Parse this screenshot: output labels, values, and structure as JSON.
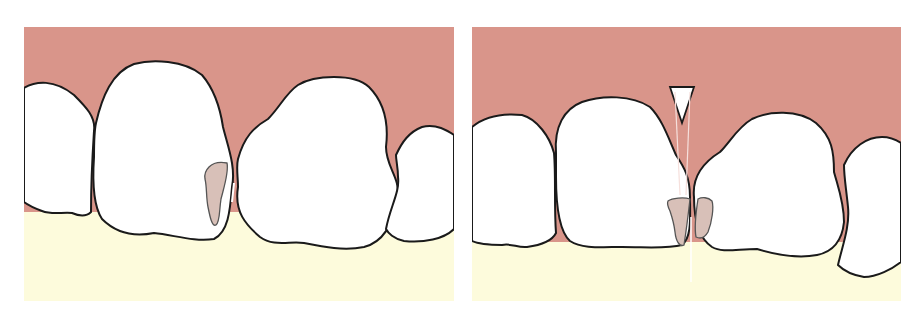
{
  "figure": {
    "panels": [
      {
        "id": "left",
        "description": "Two central incisors with interproximal caries lesion on mesial surface of left tooth; gingiva intact between teeth",
        "elements": [
          "gingiva",
          "lateral-incisor-left",
          "central-incisor-left",
          "central-incisor-right",
          "lateral-incisor-right",
          "caries-lesion"
        ]
      },
      {
        "id": "right",
        "description": "Same teeth with wooden wedge inserted interproximally separating the teeth; lesions on both adjacent surfaces",
        "elements": [
          "gingiva",
          "lateral-incisor-left",
          "central-incisor-left",
          "central-incisor-right",
          "lateral-incisor-right",
          "wedge",
          "caries-lesion-left",
          "caries-lesion-right"
        ]
      }
    ],
    "colors": {
      "gingiva": "#d9958a",
      "attached_area": "#fdfbdc",
      "tooth": "#ffffff",
      "outline": "#1a1a1a",
      "lesion": "#d8c0b8",
      "background": "#ffffff"
    }
  }
}
